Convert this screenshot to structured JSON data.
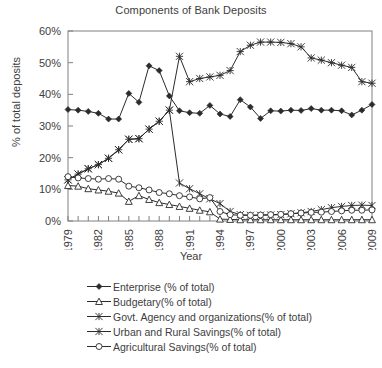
{
  "chart_data": {
    "type": "line",
    "title": "Components of Bank Deposits",
    "xlabel": "Year",
    "ylabel": "% of total deposits",
    "ylim": [
      0,
      60
    ],
    "ytick_labels": [
      "0%",
      "10%",
      "20%",
      "30%",
      "40%",
      "50%",
      "60%"
    ],
    "ytick_values": [
      0,
      10,
      20,
      30,
      40,
      50,
      60
    ],
    "xlim": [
      1979,
      2009
    ],
    "xtick_labels": [
      "1979",
      "1982",
      "1985",
      "1988",
      "1991",
      "1994",
      "1997",
      "2000",
      "2003",
      "2006",
      "2009"
    ],
    "xtick_values": [
      1979,
      1982,
      1985,
      1988,
      1991,
      1994,
      1997,
      2000,
      2003,
      2006,
      2009
    ],
    "grid": false,
    "legend_position": "below",
    "x": [
      1979,
      1980,
      1981,
      1982,
      1983,
      1984,
      1985,
      1986,
      1987,
      1988,
      1989,
      1990,
      1991,
      1992,
      1993,
      1994,
      1995,
      1996,
      1997,
      1998,
      1999,
      2000,
      2001,
      2002,
      2003,
      2004,
      2005,
      2006,
      2007,
      2008,
      2009
    ],
    "series": [
      {
        "name": "Enterprise (% of total)",
        "marker": "filled-diamond",
        "values": [
          35.2,
          35.0,
          34.6,
          34.0,
          32.2,
          32.2,
          40.3,
          37.5,
          49.0,
          47.5,
          39.5,
          34.8,
          34.2,
          34.0,
          36.5,
          33.8,
          33.0,
          38.3,
          36.0,
          32.4,
          34.8,
          34.7,
          35.0,
          34.9,
          35.5,
          35.0,
          35.0,
          34.8,
          33.5,
          35.0,
          36.8
        ]
      },
      {
        "name": "Budgetary(% of total)",
        "marker": "open-triangle",
        "values": [
          11.2,
          11.0,
          10.2,
          9.8,
          9.4,
          8.8,
          6.2,
          8.0,
          6.8,
          5.8,
          5.2,
          4.6,
          4.0,
          3.4,
          2.9,
          0.6,
          0.5,
          0.4,
          0.4,
          0.4,
          0.4,
          0.4,
          0.4,
          0.4,
          0.4,
          0.4,
          0.4,
          0.4,
          0.4,
          0.4,
          0.4
        ]
      },
      {
        "name": "Govt. Agency and organizations(% of total)",
        "marker": "cross-star",
        "values": [
          13.0,
          14.8,
          16.5,
          17.8,
          19.8,
          22.5,
          25.8,
          26.0,
          29.0,
          31.5,
          35.0,
          12.0,
          10.2,
          8.6,
          7.0,
          5.5,
          3.0,
          2.0,
          1.8,
          1.8,
          1.9,
          2.0,
          2.3,
          2.6,
          3.0,
          3.6,
          4.2,
          4.6,
          4.9,
          5.0,
          4.9
        ]
      },
      {
        "name": "Urban and Rural Savings(% of total)",
        "marker": "asterisk-star",
        "values": [
          13.0,
          14.8,
          16.5,
          17.8,
          19.8,
          22.5,
          25.8,
          26.0,
          29.0,
          31.5,
          35.0,
          52.0,
          44.0,
          45.0,
          45.5,
          46.0,
          47.5,
          53.5,
          55.5,
          56.5,
          56.5,
          56.4,
          56.0,
          55.0,
          51.5,
          50.8,
          50.0,
          49.2,
          48.5,
          44.0,
          43.5
        ]
      },
      {
        "name": "Agricultural Savings(% of total)",
        "marker": "open-circle",
        "values": [
          14.0,
          13.6,
          13.4,
          13.2,
          13.4,
          13.2,
          11.0,
          10.5,
          9.8,
          9.0,
          8.6,
          8.0,
          7.6,
          7.0,
          7.4,
          3.0,
          2.0,
          1.8,
          1.8,
          1.9,
          2.0,
          2.1,
          2.3,
          2.5,
          2.7,
          2.8,
          3.0,
          3.2,
          3.4,
          3.4,
          3.5
        ]
      }
    ]
  },
  "legend": {
    "items": [
      {
        "label": "Enterprise (% of total)",
        "marker": "filled-diamond"
      },
      {
        "label": "Budgetary(% of total)",
        "marker": "open-triangle"
      },
      {
        "label": "Govt. Agency and organizations(% of total)",
        "marker": "cross-star"
      },
      {
        "label": "Urban and Rural Savings(% of total)",
        "marker": "asterisk-star"
      },
      {
        "label": "Agricultural Savings(% of total)",
        "marker": "open-circle"
      }
    ]
  },
  "colors": {
    "ink": "#2b2b2b",
    "text": "#3d3d3d",
    "axis": "#808080"
  }
}
